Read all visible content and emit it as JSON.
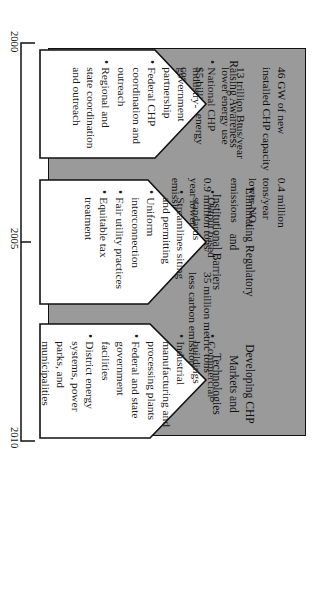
{
  "figure": {
    "type": "roadmap-arrow-diagram",
    "orientation": "rotated-90"
  },
  "benefits_box": {
    "fill_color": "#9a9a9a",
    "border_color": "#111111",
    "items": [
      "46 GW of new installed CHP capacity",
      "13 trillion Btus/year lower energy use",
      "$5 billion energy cost savings",
      "0.4 million tons/year lower NO",
      "0.9 million tons/ year lower SO",
      "35 million metric tons less carbon emissions"
    ],
    "item_1_line_1": "46 GW of new",
    "item_1_line_2": "installed CHP capacity",
    "item_2_line_1": "13 trillion Btus/year",
    "item_2_line_2": "lower energy use",
    "item_3_line_1": "$5 billion energy",
    "item_3_line_2": "cost savings",
    "item_4_line_1": "0.4 million tons/year",
    "item_4_line_2_pre": "lower NO",
    "item_4_sub": "x",
    "item_4_line_2_post": " emissions",
    "item_5_line_1": "0.9 million tons/",
    "item_5_line_2_pre": "year lower SO",
    "item_5_sub": "2",
    "item_5_line_3": "emissions",
    "item_6_line_1": "35 million metric tons",
    "item_6_line_2": "less carbon emissions"
  },
  "tracks": [
    {
      "label_lines": [
        "Raising Awareness"
      ],
      "bullets": [
        "National CHP industry-government partnership",
        "Federal CHP coordination and outreach",
        "Regional and state coordination and outreach"
      ]
    },
    {
      "label_lines": [
        "Eliminating Regulatory",
        "and",
        "Institutional Barriers"
      ],
      "bullets": [
        "Output based standards",
        "Streamlines siting and permitting",
        "Uniform interconnection",
        "Fair utility practices",
        "Equitable tax treatment"
      ]
    },
    {
      "label_lines": [
        "Developing CHP",
        "Markets and",
        "Technologies"
      ],
      "bullets": [
        "Commercial buildings",
        "Industrial manufacturing and processing plants",
        "Federal and state government facilities",
        "District energy systems, power parks, and municipalities"
      ]
    }
  ],
  "bullet_glyph": "•",
  "timeline": {
    "ticks": [
      "2000",
      "2005",
      "2010"
    ],
    "start": "2000",
    "middle": "2005",
    "end": "2010"
  }
}
